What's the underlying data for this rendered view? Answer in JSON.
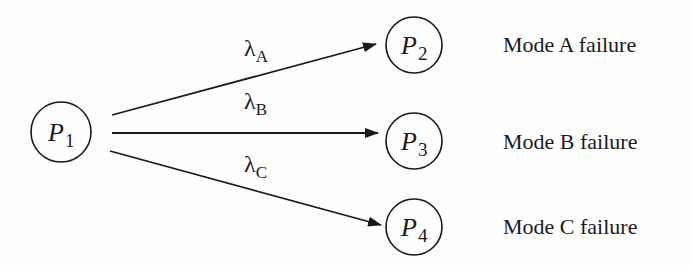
{
  "diagram": {
    "type": "state-transition",
    "colors": {
      "stroke": "#1a1a1a",
      "background": "#fefefe"
    },
    "nodes": [
      {
        "id": "P1",
        "symbol": "P",
        "subscript": "1",
        "description": ""
      },
      {
        "id": "P2",
        "symbol": "P",
        "subscript": "2",
        "description": "Mode A failure"
      },
      {
        "id": "P3",
        "symbol": "P",
        "subscript": "3",
        "description": "Mode B failure"
      },
      {
        "id": "P4",
        "symbol": "P",
        "subscript": "4",
        "description": "Mode C failure"
      }
    ],
    "edges": [
      {
        "from": "P1",
        "to": "P2",
        "symbol": "λ",
        "subscript": "A"
      },
      {
        "from": "P1",
        "to": "P3",
        "symbol": "λ",
        "subscript": "B"
      },
      {
        "from": "P1",
        "to": "P4",
        "symbol": "λ",
        "subscript": "C"
      }
    ]
  }
}
